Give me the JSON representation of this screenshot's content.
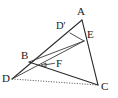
{
  "figure": {
    "background_color": "#ffffff",
    "stroke_color": "#2b2b2b",
    "label_color": "#1a1a1a",
    "width": 118,
    "height": 98
  },
  "points": [
    {
      "id": "A",
      "label": "A",
      "x": 82,
      "y": 20,
      "label_x": 77,
      "label_y": 6,
      "role": "apex-vertex"
    },
    {
      "id": "B",
      "label": "B",
      "x": 29,
      "y": 62,
      "label_x": 21,
      "label_y": 50,
      "role": "left-vertex"
    },
    {
      "id": "C",
      "label": "C",
      "x": 98,
      "y": 85,
      "label_x": 101,
      "label_y": 81,
      "role": "bottom-right-vertex"
    },
    {
      "id": "D",
      "label": "D",
      "x": 12,
      "y": 79,
      "label_x": 2,
      "label_y": 73,
      "role": "extended-vertex"
    },
    {
      "id": "Dp",
      "label": "D'",
      "x": 70,
      "y": 33,
      "label_x": 56,
      "label_y": 21,
      "role": "point-on-segment"
    },
    {
      "id": "E",
      "label": "E",
      "x": 84,
      "y": 41,
      "label_x": 87,
      "label_y": 29,
      "role": "point-on-segment"
    },
    {
      "id": "F",
      "label": "F",
      "x": 41,
      "y": 65,
      "label_x": 56,
      "label_y": 58,
      "role": "interior-intersection"
    }
  ],
  "segments": [
    {
      "id": "seg-D-A",
      "from": "D",
      "to": "A",
      "style": "solid",
      "note": "long ray from D through B and D-prime up to A"
    },
    {
      "id": "seg-A-C",
      "from": "A",
      "to": "C",
      "style": "solid",
      "note": "right side of triangle, passes through E"
    },
    {
      "id": "seg-Dp-E",
      "from": "Dp",
      "to": "E",
      "style": "solid",
      "note": "short chord near apex"
    },
    {
      "id": "seg-B-C",
      "from": "B",
      "to": "C",
      "style": "solid",
      "note": "lower side"
    },
    {
      "id": "seg-D-E",
      "from": "D",
      "to": "E",
      "style": "solid",
      "note": "cevian from D to E through F"
    },
    {
      "id": "seg-D-C",
      "from": "D",
      "to": "C",
      "style": "dotted",
      "note": "dotted base line"
    }
  ],
  "annotations": {
    "f_leader": {
      "id": "leader-F",
      "description": "arrow from the F label pointing left to the interior point F",
      "tail_x": 55,
      "tail_y": 63,
      "head_x": 43,
      "head_y": 65
    }
  },
  "labels": {
    "A": "A",
    "B": "B",
    "C": "C",
    "D": "D",
    "Dprime": "D'",
    "E": "E",
    "F": "F"
  }
}
